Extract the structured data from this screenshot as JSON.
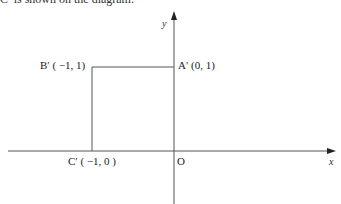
{
  "caption": "C′ is shown on the diagram.",
  "axes": {
    "x_label": "x",
    "y_label": "y",
    "origin_label": "O"
  },
  "points": [
    {
      "id": "A",
      "label": "A′ (0, 1)",
      "x": 0,
      "y": 1
    },
    {
      "id": "B",
      "label": "B′ ( −1, 1)",
      "x": -1,
      "y": 1
    },
    {
      "id": "C",
      "label": "C′ ( −1, 0 )",
      "x": -1,
      "y": 0
    }
  ],
  "colors": {
    "line": "#555555",
    "text": "#222222"
  }
}
